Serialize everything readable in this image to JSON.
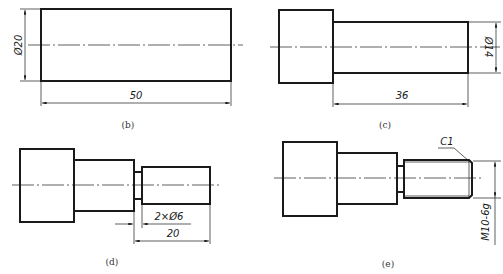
{
  "figures": [
    {
      "id": "b",
      "caption": "(b)",
      "dims": {
        "diameter": "Ø20",
        "length": "50"
      }
    },
    {
      "id": "c",
      "caption": "(c)",
      "dims": {
        "diameter": "Ø14",
        "length": "36"
      }
    },
    {
      "id": "d",
      "caption": "(d)",
      "dims": {
        "groove": "2×Ø6",
        "length": "20"
      }
    },
    {
      "id": "e",
      "caption": "(e)",
      "dims": {
        "chamfer": "C1",
        "thread": "M10-6g"
      }
    }
  ],
  "colors": {
    "line": "#1a1a1a",
    "background": "#ffffff"
  }
}
